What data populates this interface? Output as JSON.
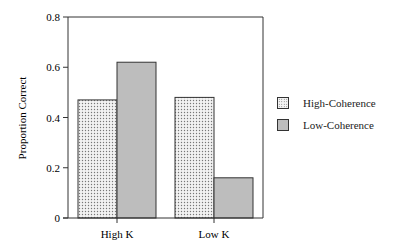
{
  "chart_data": {
    "type": "bar",
    "title": "",
    "xlabel": "",
    "ylabel": "Proportion Correct",
    "ylim": [
      0,
      0.8
    ],
    "yticks": [
      "0",
      "0.2",
      "0.4",
      "0.6",
      "0.8"
    ],
    "categories": [
      "High K",
      "Low K"
    ],
    "series": [
      {
        "name": "High-Coherence",
        "values": [
          0.47,
          0.48
        ],
        "fill": "dotted",
        "color": "#e8e8e8"
      },
      {
        "name": "Low-Coherence",
        "values": [
          0.62,
          0.16
        ],
        "fill": "gray",
        "color": "#bdbdbd"
      }
    ],
    "grid": false,
    "legend_position": "right"
  },
  "legend": {
    "items": [
      {
        "label": "High-Coherence"
      },
      {
        "label": "Low-Coherence"
      }
    ]
  }
}
